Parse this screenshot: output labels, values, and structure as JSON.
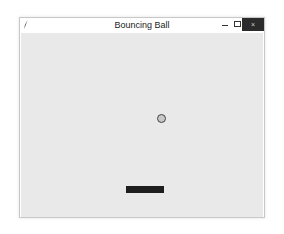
{
  "window": {
    "title": "Bouncing Ball",
    "controls": {
      "minimize": "minimize",
      "maximize": "maximize",
      "close_glyph": "×"
    },
    "icon": "feather-icon"
  },
  "canvas": {
    "background": "#e9e9e9",
    "ball": {
      "fill": "#c8c8c8",
      "outline": "#444444"
    },
    "paddle": {
      "fill": "#1e1e1e"
    }
  }
}
